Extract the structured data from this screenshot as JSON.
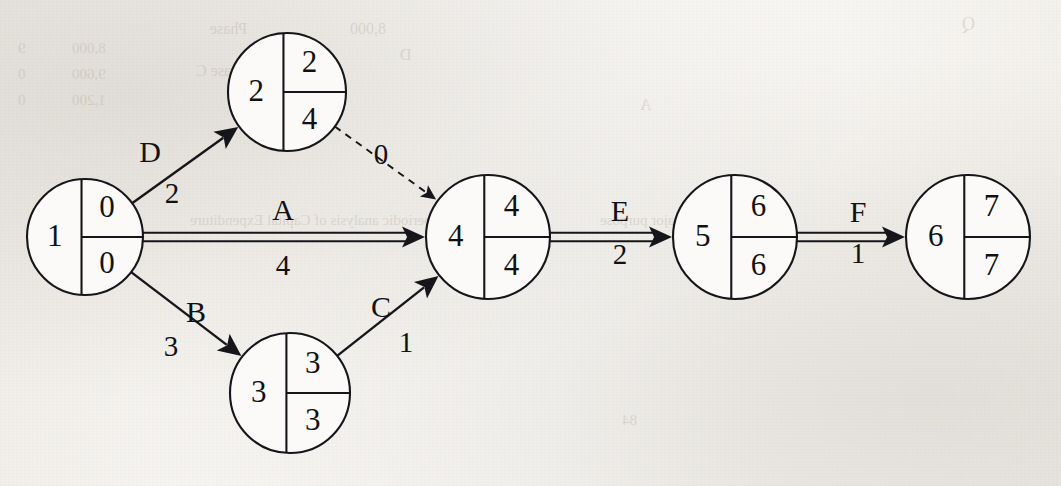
{
  "diagram": {
    "node_radius_default": 60,
    "nodes": [
      {
        "id": "1",
        "label": "1",
        "early": "0",
        "late": "0",
        "cx": 85,
        "cy": 237,
        "r": 58
      },
      {
        "id": "2",
        "label": "2",
        "early": "2",
        "late": "4",
        "cx": 287,
        "cy": 92,
        "r": 59
      },
      {
        "id": "3",
        "label": "3",
        "early": "3",
        "late": "3",
        "cx": 290,
        "cy": 393,
        "r": 60
      },
      {
        "id": "4",
        "label": "4",
        "early": "4",
        "late": "4",
        "cx": 488,
        "cy": 237,
        "r": 62
      },
      {
        "id": "5",
        "label": "5",
        "early": "6",
        "late": "6",
        "cx": 735,
        "cy": 237,
        "r": 62
      },
      {
        "id": "6",
        "label": "6",
        "early": "7",
        "late": "7",
        "cx": 968,
        "cy": 237,
        "r": 62
      }
    ],
    "edges": [
      {
        "id": "D",
        "label": "D",
        "duration": "2",
        "from": "1",
        "to": "2",
        "style": "single",
        "label_x": 150,
        "label_y": 155,
        "dur_x": 172,
        "dur_y": 196
      },
      {
        "id": "A",
        "label": "A",
        "duration": "4",
        "from": "1",
        "to": "4",
        "style": "double",
        "label_x": 283,
        "label_y": 213,
        "dur_x": 283,
        "dur_y": 268
      },
      {
        "id": "B",
        "label": "B",
        "duration": "3",
        "from": "1",
        "to": "3",
        "style": "single",
        "label_x": 196,
        "label_y": 315,
        "dur_x": 171,
        "dur_y": 349
      },
      {
        "id": "C",
        "label": "C",
        "duration": "1",
        "from": "3",
        "to": "4",
        "style": "single",
        "label_x": 381,
        "label_y": 310,
        "dur_x": 406,
        "dur_y": 345
      },
      {
        "id": "E",
        "label": "E",
        "duration": "2",
        "from": "4",
        "to": "5",
        "style": "double",
        "label_x": 620,
        "label_y": 214,
        "dur_x": 620,
        "dur_y": 257
      },
      {
        "id": "F",
        "label": "F",
        "duration": "1",
        "from": "5",
        "to": "6",
        "style": "double",
        "label_x": 858,
        "label_y": 215,
        "dur_x": 858,
        "dur_y": 256
      },
      {
        "id": "dummy",
        "label": "",
        "duration": "0",
        "from": "2",
        "to": "4",
        "style": "dashed",
        "label_x": 381,
        "label_y": 157,
        "dur_x": 381,
        "dur_y": 157
      }
    ],
    "bleed_text": [
      {
        "text": "8,000",
        "x": 72,
        "y": 40,
        "size": 15
      },
      {
        "text": "9,600",
        "x": 72,
        "y": 66,
        "size": 15
      },
      {
        "text": "1,200",
        "x": 72,
        "y": 92,
        "size": 15
      },
      {
        "text": "9",
        "x": 18,
        "y": 40,
        "size": 15
      },
      {
        "text": "0",
        "x": 18,
        "y": 66,
        "size": 15
      },
      {
        "text": "0",
        "x": 18,
        "y": 92,
        "size": 15
      },
      {
        "text": "Phase",
        "x": 210,
        "y": 20,
        "size": 16
      },
      {
        "text": "8,000",
        "x": 350,
        "y": 20,
        "size": 16
      },
      {
        "text": "Phase C",
        "x": 196,
        "y": 62,
        "size": 16
      },
      {
        "text": "B",
        "x": 300,
        "y": 62,
        "size": 16
      },
      {
        "text": "D",
        "x": 400,
        "y": 46,
        "size": 16
      },
      {
        "text": "the periodic analysis of Capital Expenditure",
        "x": 190,
        "y": 212,
        "size": 15
      },
      {
        "text": "is a major purpose",
        "x": 600,
        "y": 212,
        "size": 15
      },
      {
        "text": "A",
        "x": 640,
        "y": 96,
        "size": 16
      },
      {
        "text": "Q",
        "x": 962,
        "y": 14,
        "size": 18
      },
      {
        "text": "84",
        "x": 622,
        "y": 412,
        "size": 15
      }
    ]
  }
}
